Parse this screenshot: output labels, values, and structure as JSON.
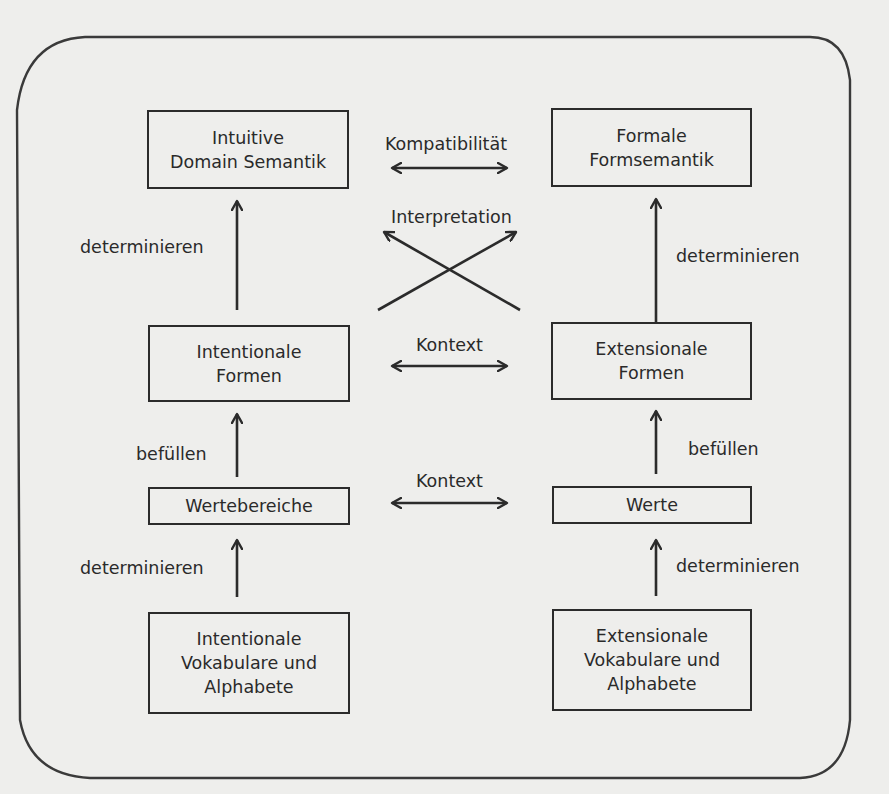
{
  "diagram": {
    "nodes": {
      "intuitive_domain_semantik": {
        "label": "Intuitive\nDomain Semantik"
      },
      "formale_formsemantik": {
        "label": "Formale\nFormsemantik"
      },
      "intentionale_formen": {
        "label": "Intentionale\nFormen"
      },
      "extensionale_formen": {
        "label": "Extensionale\nFormen"
      },
      "wertebereiche": {
        "label": "Wertebereiche"
      },
      "werte": {
        "label": "Werte"
      },
      "intentionale_vokabulare": {
        "label": "Intentionale\nVokabulare und\nAlphabete"
      },
      "extensionale_vokabulare": {
        "label": "Extensionale\nVokabulare und\nAlphabete"
      }
    },
    "edges": {
      "kompatibilitaet": {
        "label": "Kompatibilität",
        "from": "intuitive_domain_semantik",
        "to": "formale_formsemantik",
        "direction": "bidirectional"
      },
      "interpretation": {
        "label": "Interpretation",
        "type": "crossing",
        "from_a": "intentionale_formen",
        "to_a": "formale_formsemantik",
        "from_b": "extensionale_formen",
        "to_b": "intuitive_domain_semantik"
      },
      "left_determinieren_top": {
        "label": "determinieren",
        "from": "intentionale_formen",
        "to": "intuitive_domain_semantik"
      },
      "right_determinieren_top": {
        "label": "determinieren",
        "from": "extensionale_formen",
        "to": "formale_formsemantik"
      },
      "kontext_formen": {
        "label": "Kontext",
        "from": "intentionale_formen",
        "to": "extensionale_formen",
        "direction": "bidirectional"
      },
      "left_befuellen": {
        "label": "befüllen",
        "from": "wertebereiche",
        "to": "intentionale_formen"
      },
      "right_befuellen": {
        "label": "befüllen",
        "from": "werte",
        "to": "extensionale_formen"
      },
      "kontext_werte": {
        "label": "Kontext",
        "from": "wertebereiche",
        "to": "werte",
        "direction": "bidirectional"
      },
      "left_determinieren_bottom": {
        "label": "determinieren",
        "from": "intentionale_vokabulare",
        "to": "wertebereiche"
      },
      "right_determinieren_bottom": {
        "label": "determinieren",
        "from": "extensionale_vokabulare",
        "to": "werte"
      }
    }
  }
}
